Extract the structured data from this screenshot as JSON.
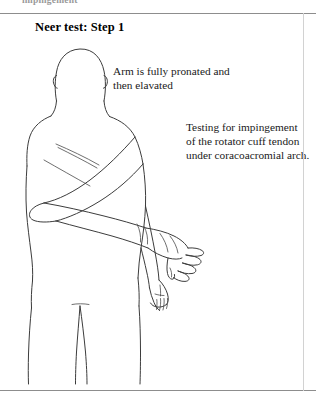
{
  "page": {
    "running_head": "impingement",
    "title": "Neer test: Step 1"
  },
  "annotations": {
    "arm_position": {
      "line1": "Arm is fully pronated and",
      "line2": "then elavated"
    },
    "purpose": {
      "line1": "Testing for impingement",
      "line2": "of the rotator cuff tendon",
      "line3": "under coracoacromial arch."
    }
  },
  "figure": {
    "ink_color": "#3c3c3c",
    "background_color": "#ffffff"
  },
  "rules": {
    "color": "#8d8d8d",
    "border_color": "#d2d2d2"
  }
}
